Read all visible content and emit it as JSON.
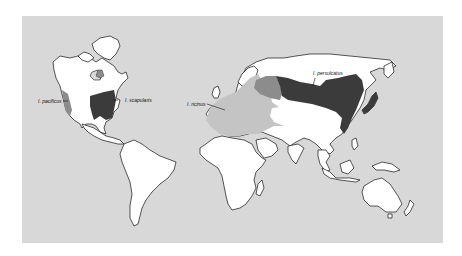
{
  "map": {
    "title": "",
    "background_color": "#d8d8d8",
    "land_color": "#ffffff",
    "species": [
      {
        "name": "I. pacificus",
        "label": "I. pacificus",
        "region": "Western North America (Pacific coast)",
        "color": "#8c8c8c"
      },
      {
        "name": "I. scapularis",
        "label": "I. scapularis",
        "region": "Eastern North America",
        "color": "#3b3b3b"
      },
      {
        "name": "I. ricinus",
        "label": "I. ricinus",
        "region": "Europe, North Africa, Middle East",
        "color": "#c4c4c4"
      },
      {
        "name": "I. persulcatus",
        "label": "I. persulcatus",
        "region": "Russia to Japan, northern Asia",
        "color": "#3b3b3b"
      }
    ],
    "overlap_region": {
      "region": "Eastern Europe / western Russia",
      "color": "#8c8c8c"
    }
  }
}
